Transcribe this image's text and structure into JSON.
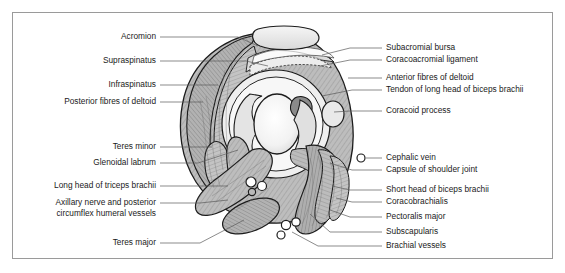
{
  "figure": {
    "title_visible": false,
    "background_color": "#ffffff",
    "border_color": "#9a9a9a",
    "illustration": {
      "name": "shoulder-joint-axial-cross-section",
      "style": "grayscale line-and-hatch anatomical drawing",
      "palette": {
        "outline": "#1a1a1a",
        "muscle_light": "#c9c9c9",
        "muscle_mid": "#a8a8a8",
        "muscle_dark": "#8a8a8a",
        "bone_light": "#ededed",
        "cavity_white": "#ffffff",
        "vessel_fill": "#ffffff"
      }
    }
  },
  "labels": {
    "left": [
      {
        "id": "acromion",
        "text": "Acromion",
        "text_x": 156,
        "text_y": 37,
        "points": [
          [
            160,
            37
          ],
          [
            238,
            37
          ],
          [
            258,
            46
          ]
        ]
      },
      {
        "id": "supraspinatus",
        "text": "Supraspinatus",
        "text_x": 156,
        "text_y": 61,
        "points": [
          [
            160,
            61
          ],
          [
            246,
            61
          ],
          [
            268,
            66
          ]
        ]
      },
      {
        "id": "infraspinatus",
        "text": "Infraspinatus",
        "text_x": 156,
        "text_y": 85,
        "points": [
          [
            160,
            85
          ],
          [
            218,
            85
          ]
        ]
      },
      {
        "id": "posterior-fibres-of-deltoid",
        "text": "Posterior fibres of deltoid",
        "text_x": 156,
        "text_y": 102,
        "points": [
          [
            160,
            102
          ],
          [
            203,
            102
          ]
        ]
      },
      {
        "id": "teres-minor",
        "text": "Teres minor",
        "text_x": 156,
        "text_y": 147,
        "points": [
          [
            160,
            147
          ],
          [
            212,
            147
          ]
        ]
      },
      {
        "id": "glenoidal-labrum",
        "text": "Glenoidal labrum",
        "text_x": 156,
        "text_y": 163,
        "points": [
          [
            160,
            163
          ],
          [
            198,
            163
          ],
          [
            238,
            150
          ]
        ]
      },
      {
        "id": "long-head-of-triceps-brachii",
        "text": "Long head of triceps brachii",
        "text_x": 156,
        "text_y": 186,
        "points": [
          [
            160,
            186
          ],
          [
            228,
            186
          ]
        ]
      },
      {
        "id": "axillary-nerve-and-posterior-circumflex-humeral-vessels",
        "text": "Axillary nerve and posterior",
        "text2": "circumflex humeral vessels",
        "text_x": 156,
        "text_y": 203,
        "text2_y": 214,
        "points": [
          [
            160,
            203
          ],
          [
            200,
            203
          ],
          [
            228,
            200
          ]
        ]
      },
      {
        "id": "teres-major",
        "text": "Teres major",
        "text_x": 156,
        "text_y": 243,
        "points": [
          [
            160,
            243
          ],
          [
            200,
            243
          ],
          [
            244,
            220
          ]
        ]
      }
    ],
    "right": [
      {
        "id": "subacromial-bursa",
        "text": "Subacromial bursa",
        "text_x": 386,
        "text_y": 48,
        "points": [
          [
            382,
            48
          ],
          [
            350,
            48
          ],
          [
            322,
            55
          ]
        ]
      },
      {
        "id": "coracoacromial-ligament",
        "text": "Coracoacromial ligament",
        "text_x": 386,
        "text_y": 60,
        "points": [
          [
            382,
            60
          ],
          [
            350,
            60
          ],
          [
            320,
            66
          ]
        ]
      },
      {
        "id": "anterior-fibres-of-deltoid",
        "text": "Anterior fibres of deltoid",
        "text_x": 386,
        "text_y": 78,
        "points": [
          [
            382,
            78
          ],
          [
            348,
            78
          ]
        ]
      },
      {
        "id": "tendon-of-long-head-of-biceps-brachii",
        "text": "Tendon of long head of biceps brachii",
        "text_x": 386,
        "text_y": 90,
        "points": [
          [
            382,
            90
          ],
          [
            352,
            90
          ],
          [
            322,
            96
          ]
        ]
      },
      {
        "id": "coracoid-process",
        "text": "Coracoid process",
        "text_x": 386,
        "text_y": 111,
        "points": [
          [
            382,
            111
          ],
          [
            350,
            111
          ],
          [
            334,
            112
          ]
        ]
      },
      {
        "id": "cephalic-vein",
        "text": "Cephalic vein",
        "text_x": 386,
        "text_y": 158,
        "points": [
          [
            382,
            158
          ],
          [
            366,
            158
          ]
        ]
      },
      {
        "id": "capsule-of-shoulder-joint",
        "text": "Capsule of shoulder joint",
        "text_x": 386,
        "text_y": 170,
        "points": [
          [
            382,
            170
          ],
          [
            352,
            170
          ],
          [
            330,
            163
          ]
        ]
      },
      {
        "id": "short-head-of-biceps-brachii",
        "text": "Short head of biceps brachii",
        "text_x": 386,
        "text_y": 190,
        "points": [
          [
            382,
            190
          ],
          [
            350,
            190
          ],
          [
            332,
            186
          ]
        ]
      },
      {
        "id": "coracobrachialis",
        "text": "Coracobrachialis",
        "text_x": 386,
        "text_y": 202,
        "points": [
          [
            382,
            202
          ],
          [
            352,
            202
          ],
          [
            336,
            198
          ]
        ]
      },
      {
        "id": "pectoralis-major",
        "text": "Pectoralis major",
        "text_x": 386,
        "text_y": 217,
        "points": [
          [
            382,
            217
          ],
          [
            350,
            217
          ],
          [
            330,
            210
          ]
        ]
      },
      {
        "id": "subscapularis",
        "text": "Subscapularis",
        "text_x": 386,
        "text_y": 232,
        "points": [
          [
            382,
            232
          ],
          [
            330,
            232
          ],
          [
            310,
            214
          ]
        ]
      },
      {
        "id": "brachial-vessels",
        "text": "Brachial vessels",
        "text_x": 386,
        "text_y": 246,
        "points": [
          [
            382,
            246
          ],
          [
            318,
            246
          ],
          [
            292,
            232
          ]
        ]
      }
    ]
  }
}
